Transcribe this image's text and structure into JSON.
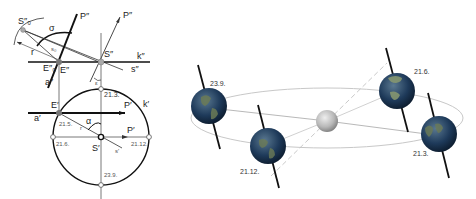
{
  "left_diagram": {
    "description": "Descriptive-geometry construction of sun direction projections",
    "labels": {
      "S_double_zero": "S″₀",
      "P_double_1": "P″",
      "P_double_2": "P″",
      "sigma": "σ",
      "r_upper": "r",
      "s_zero_upper": "s₀",
      "E_double_zero": "E″₀",
      "E_double": "E″",
      "S_double": "S″",
      "k_double": "k″",
      "s_double": "s″",
      "a_double": "a″",
      "epsilon": "ε",
      "E_single": "E′",
      "a_single": "a′",
      "P_single_1": "P′",
      "P_single_2": "P′",
      "k_single": "k′",
      "alpha": "α",
      "r_lower": "r",
      "S_single": "S′",
      "s_single": "s′"
    },
    "dates": {
      "top": "21.3.",
      "upper_left": "21.5.",
      "left": "21.6.",
      "right": "21.12.",
      "bottom": "23.9."
    }
  },
  "right_diagram": {
    "description": "Earth orbit around the Sun with tilted axis at four seasonal positions",
    "positions": [
      {
        "name": "autumn-equinox",
        "date": "23.9."
      },
      {
        "name": "winter-solstice",
        "date": "21.12."
      },
      {
        "name": "summer-solstice",
        "date": "21.6."
      },
      {
        "name": "spring-equinox",
        "date": "21.3."
      }
    ],
    "colors": {
      "orbit": "#c8c8c8",
      "axis": "#111111",
      "sun": "#b8b8b8",
      "earth_ocean": "#1e3a5a",
      "earth_land": "#6b7a55"
    }
  }
}
